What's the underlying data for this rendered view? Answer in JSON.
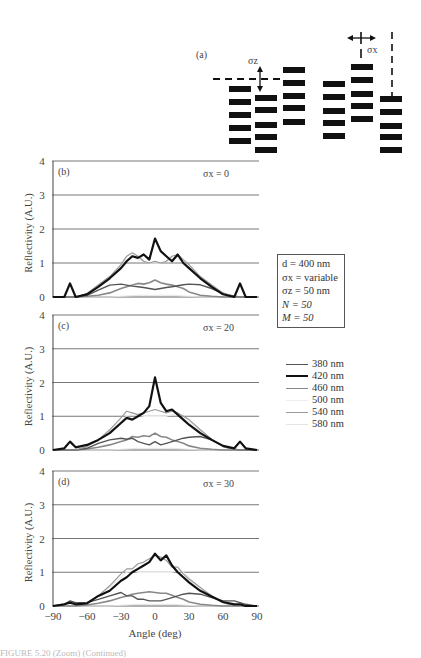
{
  "diagram": {
    "panel_label": "(a)",
    "sigma_z_label": "σz",
    "sigma_x_label": "σx",
    "columns": [
      {
        "x": 229,
        "w": 22,
        "ys": [
          86,
          99,
          112,
          125,
          138
        ]
      },
      {
        "x": 255,
        "w": 22,
        "ys": [
          95,
          107,
          122,
          134,
          147
        ]
      },
      {
        "x": 283,
        "w": 22,
        "ys": [
          67,
          80,
          93,
          105,
          119
        ]
      },
      {
        "x": 323,
        "w": 22,
        "ys": [
          81,
          94,
          108,
          120,
          133
        ]
      },
      {
        "x": 351,
        "w": 22,
        "ys": [
          64,
          77,
          91,
          103,
          116
        ]
      },
      {
        "x": 380,
        "w": 22,
        "ys": [
          96,
          109,
          123,
          134,
          147
        ]
      }
    ]
  },
  "params": {
    "d": "d = 400 nm",
    "sigma_x": "σx = variable",
    "sigma_z": "σz = 50 nm",
    "N": "N = 50",
    "M": "M = 50"
  },
  "legend": {
    "items": [
      {
        "label": "380 nm",
        "color": "#555555",
        "width": 1.4
      },
      {
        "label": "420 nm",
        "color": "#111111",
        "width": 2.2
      },
      {
        "label": "460 nm",
        "color": "#888888",
        "width": 1.6
      },
      {
        "label": "500 nm",
        "color": "#eeeeee",
        "width": 1.2
      },
      {
        "label": "540 nm",
        "color": "#999999",
        "width": 1.2
      },
      {
        "label": "580 nm",
        "color": "#e4e4e4",
        "width": 1.0
      }
    ]
  },
  "caption_fragment": "FIGURE 5.20 (Zoom) (Continued)",
  "chart_data": [
    {
      "type": "line",
      "panel": "(b)",
      "annotation": "σx = 0",
      "xlabel": "",
      "ylabel": "Reflectivity (A.U.)",
      "xlim": [
        -90,
        90
      ],
      "ylim": [
        0,
        4
      ],
      "yticks": [
        0,
        1,
        2,
        3,
        4
      ],
      "grid": true,
      "x": [
        -90,
        -80,
        -75,
        -70,
        -60,
        -50,
        -40,
        -30,
        -25,
        -20,
        -15,
        -10,
        -5,
        0,
        5,
        10,
        15,
        20,
        25,
        30,
        40,
        50,
        60,
        70,
        75,
        80,
        90
      ],
      "series": [
        {
          "name": "380 nm",
          "values": [
            0,
            0,
            0,
            0,
            0.05,
            0.2,
            0.35,
            0.38,
            0.35,
            0.32,
            0.3,
            0.28,
            0.25,
            0.22,
            0.25,
            0.28,
            0.3,
            0.33,
            0.36,
            0.38,
            0.36,
            0.25,
            0.1,
            0.02,
            0,
            0,
            0
          ]
        },
        {
          "name": "420 nm",
          "values": [
            0,
            0,
            0.4,
            0,
            0.08,
            0.3,
            0.55,
            0.85,
            1.05,
            1.2,
            1.15,
            1.25,
            1.1,
            1.72,
            1.35,
            1.2,
            1.05,
            1.25,
            1.0,
            0.85,
            0.55,
            0.3,
            0.08,
            0,
            0.4,
            0,
            0
          ]
        },
        {
          "name": "460 nm",
          "values": [
            0,
            0,
            0,
            0,
            0.02,
            0.05,
            0.12,
            0.25,
            0.3,
            0.35,
            0.4,
            0.38,
            0.42,
            0.5,
            0.42,
            0.38,
            0.35,
            0.3,
            0.25,
            0.15,
            0.05,
            0.02,
            0,
            0,
            0,
            0,
            0
          ]
        },
        {
          "name": "500 nm",
          "values": [
            0,
            0,
            0,
            0,
            0.1,
            0.35,
            0.6,
            0.9,
            1.1,
            1.2,
            1.1,
            1.05,
            1.0,
            1.0,
            1.0,
            1.05,
            1.1,
            1.15,
            1.0,
            0.9,
            0.6,
            0.35,
            0.1,
            0,
            0,
            0,
            0
          ]
        },
        {
          "name": "540 nm",
          "values": [
            0,
            0,
            0,
            0,
            0.1,
            0.35,
            0.6,
            0.95,
            1.2,
            1.3,
            1.2,
            1.05,
            1.0,
            1.05,
            1.0,
            1.05,
            1.2,
            1.25,
            1.1,
            0.95,
            0.6,
            0.35,
            0.12,
            0,
            0,
            0,
            0
          ]
        },
        {
          "name": "580 nm",
          "values": [
            0,
            0,
            0,
            0,
            0,
            0,
            0,
            0.02,
            0.03,
            0.04,
            0.05,
            0.05,
            0.05,
            0.05,
            0.05,
            0.05,
            0.05,
            0.04,
            0.03,
            0.02,
            0,
            0,
            0,
            0,
            0,
            0,
            0
          ]
        }
      ]
    },
    {
      "type": "line",
      "panel": "(c)",
      "annotation": "σx = 20",
      "xlabel": "",
      "ylabel": "Reflectivity (A.U.)",
      "xlim": [
        -90,
        90
      ],
      "ylim": [
        0,
        4
      ],
      "yticks": [
        0,
        1,
        2,
        3,
        4
      ],
      "grid": true,
      "x": [
        -90,
        -80,
        -75,
        -70,
        -60,
        -50,
        -40,
        -30,
        -25,
        -20,
        -15,
        -10,
        -5,
        0,
        5,
        10,
        15,
        20,
        25,
        30,
        40,
        50,
        60,
        70,
        75,
        80,
        90
      ],
      "series": [
        {
          "name": "380 nm",
          "values": [
            0,
            0,
            0,
            0,
            0.05,
            0.2,
            0.3,
            0.35,
            0.32,
            0.35,
            0.25,
            0.2,
            0.15,
            0.25,
            0.15,
            0.2,
            0.25,
            0.3,
            0.35,
            0.38,
            0.4,
            0.3,
            0.12,
            0.02,
            0,
            0,
            0
          ]
        },
        {
          "name": "420 nm",
          "values": [
            0,
            0.05,
            0.25,
            0.08,
            0.15,
            0.3,
            0.5,
            0.8,
            0.95,
            0.9,
            1.0,
            1.1,
            1.3,
            2.15,
            1.4,
            1.15,
            1.2,
            1.05,
            0.9,
            0.75,
            0.5,
            0.3,
            0.12,
            0.05,
            0.25,
            0.05,
            0
          ]
        },
        {
          "name": "460 nm",
          "values": [
            0,
            0,
            0,
            0,
            0.03,
            0.08,
            0.15,
            0.25,
            0.3,
            0.4,
            0.38,
            0.42,
            0.4,
            0.5,
            0.4,
            0.38,
            0.3,
            0.25,
            0.2,
            0.12,
            0.05,
            0.02,
            0,
            0,
            0,
            0,
            0
          ]
        },
        {
          "name": "500 nm",
          "values": [
            0,
            0,
            0,
            0,
            0.1,
            0.3,
            0.55,
            0.85,
            1.0,
            1.1,
            1.05,
            1.0,
            1.0,
            1.0,
            1.0,
            1.0,
            1.05,
            1.1,
            1.0,
            0.85,
            0.55,
            0.3,
            0.1,
            0,
            0,
            0,
            0
          ]
        },
        {
          "name": "540 nm",
          "values": [
            0,
            0,
            0,
            0,
            0.1,
            0.3,
            0.6,
            0.95,
            1.15,
            1.1,
            1.05,
            1.1,
            1.15,
            1.2,
            1.15,
            1.1,
            1.15,
            1.1,
            1.0,
            0.9,
            0.6,
            0.32,
            0.1,
            0,
            0,
            0,
            0
          ]
        },
        {
          "name": "580 nm",
          "values": [
            0,
            0,
            0,
            0,
            0,
            0,
            0,
            0.02,
            0.03,
            0.04,
            0.05,
            0.05,
            0.05,
            0.05,
            0.05,
            0.05,
            0.05,
            0.04,
            0.03,
            0.02,
            0,
            0,
            0,
            0,
            0,
            0,
            0
          ]
        }
      ]
    },
    {
      "type": "line",
      "panel": "(d)",
      "annotation": "σx = 30",
      "xlabel": "Angle (deg)",
      "ylabel": "Reflectivity (A.U.)",
      "xlim": [
        -90,
        90
      ],
      "ylim": [
        0,
        4
      ],
      "xticks": [
        -90,
        -60,
        -30,
        0,
        30,
        60,
        90
      ],
      "yticks": [
        0,
        1,
        2,
        3,
        4
      ],
      "grid": true,
      "x": [
        -90,
        -80,
        -75,
        -70,
        -60,
        -50,
        -40,
        -30,
        -25,
        -20,
        -15,
        -10,
        -5,
        0,
        5,
        10,
        15,
        20,
        25,
        30,
        40,
        50,
        60,
        70,
        75,
        80,
        90
      ],
      "series": [
        {
          "name": "380 nm",
          "values": [
            0,
            0.05,
            0.15,
            0.1,
            0.1,
            0.2,
            0.3,
            0.4,
            0.3,
            0.3,
            0.2,
            0.2,
            0.15,
            0.15,
            0.15,
            0.2,
            0.25,
            0.3,
            0.35,
            0.38,
            0.35,
            0.25,
            0.15,
            0.15,
            0.1,
            0.05,
            0
          ]
        },
        {
          "name": "420 nm",
          "values": [
            0,
            0.05,
            0.1,
            0.05,
            0.08,
            0.3,
            0.45,
            0.75,
            0.85,
            1.0,
            1.1,
            1.2,
            1.3,
            1.55,
            1.35,
            1.5,
            1.2,
            1.0,
            0.85,
            0.7,
            0.45,
            0.28,
            0.12,
            0.05,
            0.05,
            0,
            0
          ]
        },
        {
          "name": "460 nm",
          "values": [
            0,
            0,
            0,
            0,
            0.03,
            0.08,
            0.15,
            0.25,
            0.3,
            0.35,
            0.38,
            0.4,
            0.42,
            0.4,
            0.38,
            0.38,
            0.32,
            0.25,
            0.2,
            0.12,
            0.05,
            0.02,
            0,
            0,
            0,
            0,
            0
          ]
        },
        {
          "name": "500 nm",
          "values": [
            0,
            0,
            0,
            0,
            0.1,
            0.3,
            0.55,
            0.85,
            1.0,
            1.05,
            1.0,
            1.0,
            1.0,
            1.0,
            1.0,
            1.0,
            1.0,
            1.05,
            1.0,
            0.85,
            0.55,
            0.3,
            0.1,
            0,
            0,
            0,
            0
          ]
        },
        {
          "name": "540 nm",
          "values": [
            0,
            0,
            0,
            0,
            0.1,
            0.3,
            0.6,
            0.95,
            1.1,
            1.1,
            1.25,
            1.3,
            1.4,
            1.5,
            1.45,
            1.35,
            1.15,
            1.15,
            0.95,
            0.8,
            0.55,
            0.3,
            0.1,
            0,
            0,
            0,
            0
          ]
        },
        {
          "name": "580 nm",
          "values": [
            0,
            0,
            0,
            0,
            0,
            0,
            0,
            0.02,
            0.03,
            0.04,
            0.05,
            0.05,
            0.05,
            0.05,
            0.05,
            0.05,
            0.05,
            0.04,
            0.03,
            0.02,
            0,
            0,
            0,
            0,
            0,
            0,
            0
          ]
        }
      ]
    }
  ]
}
